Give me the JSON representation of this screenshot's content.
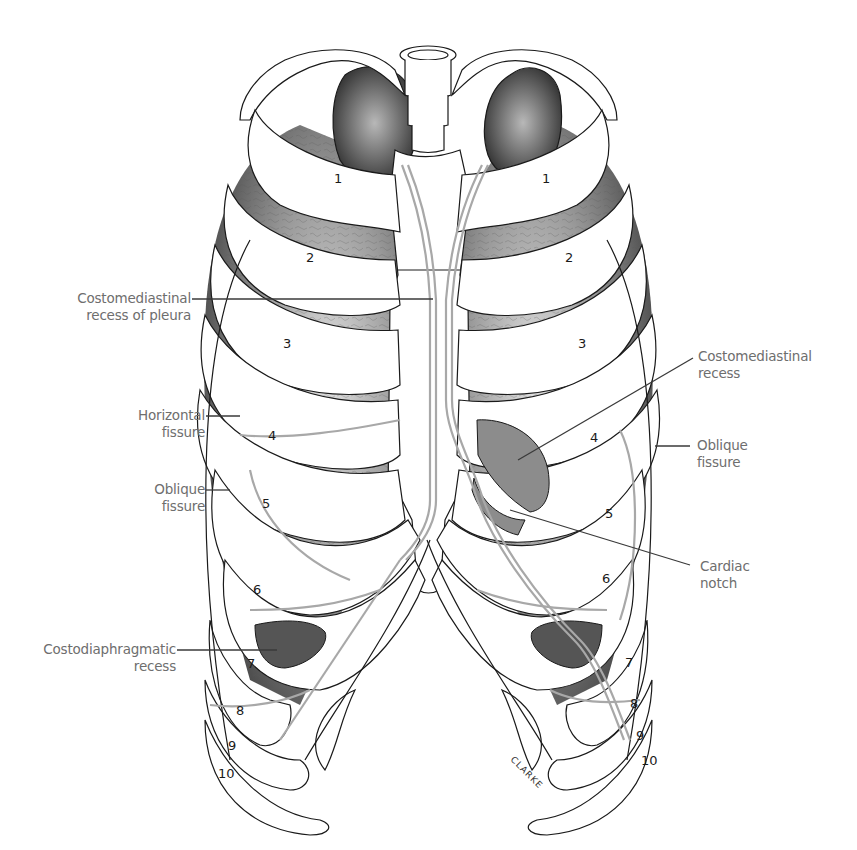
{
  "figure": {
    "signature": "CLARKE",
    "colors": {
      "outline": "#1a1a1a",
      "pleura_line": "#a8a8a8",
      "lung_dark": "#3a3a3a",
      "lung_mid": "#8a8a8a",
      "lung_light": "#d0d0d0",
      "recess_fill": "#8c8c8c",
      "label_text": "#6e6e6e",
      "leader_line": "#3a3a3a"
    }
  },
  "labels": {
    "costomediastinal_pleura": {
      "line1": "Costomediastinal",
      "line2": "recess of pleura"
    },
    "horizontal_fissure": {
      "line1": "Horizontal",
      "line2": "fissure"
    },
    "oblique_fissure_left": {
      "line1": "Oblique",
      "line2": "fissure"
    },
    "costodiaphragmatic": {
      "line1": "Costodiaphragmatic",
      "line2": "recess"
    },
    "costomediastinal_recess": {
      "line1": "Costomediastinal",
      "line2": "recess"
    },
    "oblique_fissure_right": {
      "line1": "Oblique",
      "line2": "fissure"
    },
    "cardiac_notch": {
      "line1": "Cardiac",
      "line2": "notch"
    }
  },
  "rib_numbers": {
    "left": [
      "1",
      "2",
      "3",
      "4",
      "5",
      "6",
      "7",
      "8",
      "9",
      "10"
    ],
    "right": [
      "1",
      "2",
      "3",
      "4",
      "5",
      "6",
      "7",
      "8",
      "9",
      "10"
    ]
  }
}
